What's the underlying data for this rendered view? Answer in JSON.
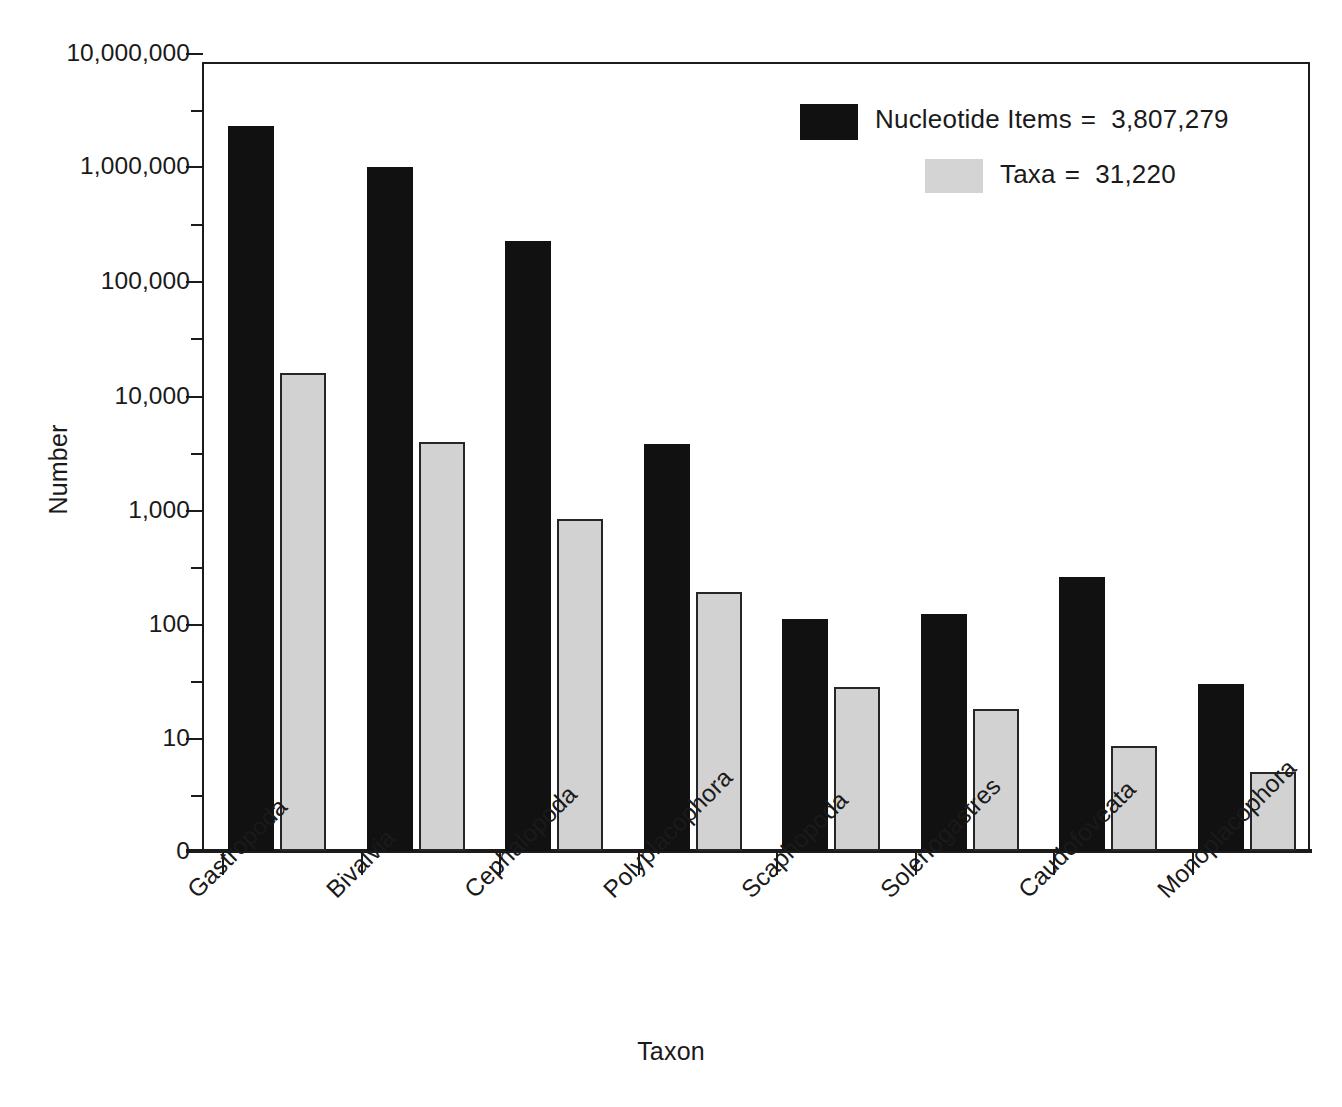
{
  "chart_data": {
    "type": "bar",
    "title": "",
    "xlabel": "Taxon",
    "ylabel": "Number",
    "yscale": "log",
    "ylim": [
      1,
      10000000
    ],
    "ytick_labels": [
      "10,000,000",
      "1,000,000",
      "100,000",
      "10,000",
      "1,000",
      "100",
      "10",
      "0"
    ],
    "ytick_values": [
      10000000,
      1000000,
      100000,
      10000,
      1000,
      100,
      10,
      0
    ],
    "grid": false,
    "legend_position": "top-right",
    "categories": [
      "Gastropoda",
      "Bivalvia",
      "Cephalopoda",
      "Polyplacophora",
      "Scaphopoda",
      "Solenogastres",
      "Caudofoveata",
      "Monoplacophora"
    ],
    "series": [
      {
        "name": "Nucleotide Items",
        "color": "#111111",
        "total": 3807279,
        "total_label": "3,807,279",
        "values": [
          2400000,
          1050000,
          235000,
          3800,
          112,
          123,
          260,
          30
        ]
      },
      {
        "name": "Taxa",
        "color": "#d2d2d2",
        "total": 31220,
        "total_label": "31,220",
        "values": [
          16000,
          4000,
          840,
          190,
          28,
          18,
          8.5,
          5
        ]
      }
    ]
  },
  "legend": {
    "rows": [
      {
        "label": "Nucleotide Items",
        "equals": "=",
        "value": "3,807,279",
        "swatch": "black-swatch"
      },
      {
        "label": "Taxa",
        "equals": "=",
        "value": "31,220",
        "swatch": "gray-swatch"
      }
    ]
  },
  "axes": {
    "y_title": "Number",
    "x_title": "Taxon"
  }
}
